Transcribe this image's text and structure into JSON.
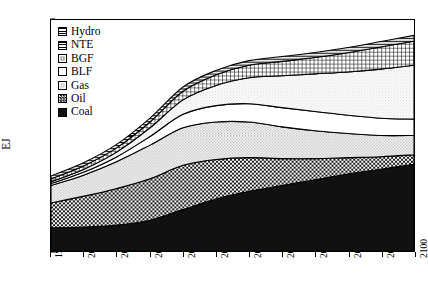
{
  "chart_data": {
    "type": "area",
    "title": "SOTC",
    "xlabel": "",
    "ylabel": "EJ",
    "xlim": [
      1990,
      2100
    ],
    "ylim": [
      0,
      1200
    ],
    "grid": false,
    "stacked": true,
    "legend_position": "upper-left-inside",
    "yticks": [
      0,
      200,
      400,
      600,
      800,
      1000,
      1200
    ],
    "xticks": [
      1990,
      2000,
      2010,
      2020,
      2030,
      2040,
      2050,
      2060,
      2070,
      2080,
      2090,
      2100
    ],
    "x": [
      1990,
      2000,
      2010,
      2020,
      2030,
      2040,
      2050,
      2060,
      2070,
      2080,
      2090,
      2100
    ],
    "series": [
      {
        "name": "Coal",
        "pattern": "solid-black",
        "values": [
          120,
          125,
          135,
          160,
          215,
          270,
          310,
          340,
          370,
          400,
          425,
          450
        ]
      },
      {
        "name": "Oil",
        "pattern": "checker",
        "values": [
          130,
          160,
          190,
          215,
          230,
          205,
          175,
          140,
          110,
          85,
          65,
          50
        ]
      },
      {
        "name": "Gas",
        "pattern": "light-gray",
        "values": [
          90,
          110,
          140,
          175,
          195,
          195,
          185,
          165,
          145,
          125,
          110,
          100
        ]
      },
      {
        "name": "BLF",
        "pattern": "white",
        "values": [
          10,
          15,
          25,
          45,
          70,
          85,
          95,
          100,
          100,
          95,
          90,
          85
        ]
      },
      {
        "name": "BGF",
        "pattern": "fine-dots",
        "values": [
          10,
          15,
          25,
          45,
          75,
          105,
          135,
          165,
          195,
          225,
          255,
          280
        ]
      },
      {
        "name": "NTE",
        "pattern": "cross-hatch",
        "values": [
          15,
          18,
          22,
          30,
          45,
          55,
          65,
          75,
          85,
          100,
          115,
          125
        ]
      },
      {
        "name": "Hydro",
        "pattern": "horiz-lines",
        "values": [
          15,
          17,
          18,
          20,
          22,
          23,
          24,
          25,
          26,
          27,
          28,
          30
        ]
      }
    ],
    "totals": [
      390,
      460,
      555,
      690,
      852,
      938,
      989,
      1010,
      1031,
      1057,
      1088,
      1120
    ]
  },
  "legend": {
    "items": [
      {
        "label": "Hydro"
      },
      {
        "label": "NTE"
      },
      {
        "label": "BGF"
      },
      {
        "label": "BLF"
      },
      {
        "label": "Gas"
      },
      {
        "label": "Oil"
      },
      {
        "label": "Coal"
      }
    ]
  }
}
